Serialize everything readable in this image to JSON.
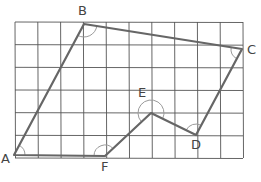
{
  "diagram": {
    "grid": {
      "columns": 10,
      "rows": 6,
      "left": 15,
      "top": 22,
      "right": 243,
      "bottom": 158,
      "line_color": "#555555"
    },
    "shape_color": "#666666",
    "arc_color": "#9a9a9a",
    "vertices": [
      {
        "name": "A",
        "label": "A",
        "x": 14,
        "y": 155,
        "lx": 1,
        "ly": 163
      },
      {
        "name": "B",
        "label": "B",
        "x": 84,
        "y": 24,
        "lx": 78,
        "ly": 15
      },
      {
        "name": "C",
        "label": "C",
        "x": 242,
        "y": 49,
        "lx": 247,
        "ly": 54
      },
      {
        "name": "D",
        "label": "D",
        "x": 196,
        "y": 135,
        "lx": 191,
        "ly": 149
      },
      {
        "name": "E",
        "label": "E",
        "x": 151,
        "y": 113,
        "lx": 138,
        "ly": 97
      },
      {
        "name": "F",
        "label": "F",
        "x": 105,
        "y": 156,
        "lx": 101,
        "ly": 171
      }
    ]
  }
}
